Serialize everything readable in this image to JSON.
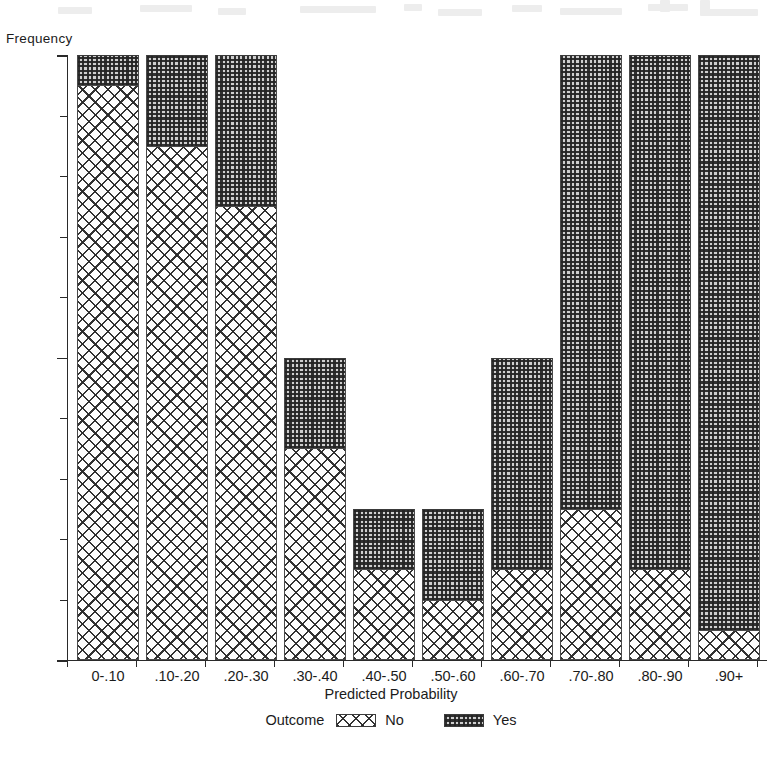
{
  "chart_data": {
    "type": "bar",
    "subtype": "stacked-bar-histogram",
    "title": "",
    "xlabel": "Predicted Probability",
    "ylabel": "Frequency",
    "ylim": [
      0,
      20
    ],
    "y_ticks": [
      0,
      10,
      20
    ],
    "y_tick_labels": [
      "0",
      "10",
      "20"
    ],
    "y_minor_tick_interval": 2,
    "grid": false,
    "legend": {
      "title": "Outcome",
      "position": "bottom",
      "entries": [
        {
          "name": "No",
          "pattern": "cross-hatch"
        },
        {
          "name": "Yes",
          "pattern": "fine-checkerboard"
        }
      ]
    },
    "categories": [
      "0-.10",
      ".10-.20",
      ".20-.30",
      ".30-.40",
      ".40-.50",
      ".50-.60",
      ".60-.70",
      ".70-.80",
      ".80-.90",
      ".90+"
    ],
    "series": [
      {
        "name": "No",
        "values": [
          19,
          17,
          15,
          7,
          3,
          2,
          3,
          5,
          3,
          1
        ]
      },
      {
        "name": "Yes",
        "values": [
          1,
          3,
          5,
          3,
          2,
          3,
          7,
          15,
          17,
          19
        ]
      }
    ],
    "totals": [
      20,
      20,
      20,
      10,
      5,
      5,
      10,
      20,
      20,
      20
    ]
  }
}
